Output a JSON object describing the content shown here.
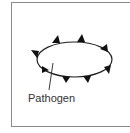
{
  "diagram": {
    "label": "Pathogen",
    "colors": {
      "outline": "#222222",
      "frame": "#8a8a8a",
      "text": "#333333"
    }
  }
}
